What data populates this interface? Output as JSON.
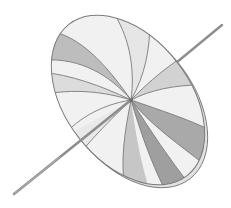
{
  "illustration": {
    "subject": "watercolor disc spinning top on a stick",
    "style": "grayscale watercolor",
    "colors": {
      "background": "#ffffff",
      "outline": "#7a7a7a",
      "light_segment": "#f1f1f1",
      "mid_segment": "#cfcfcf",
      "dark_segment": "#a9a9a9",
      "stick": "#8e8e8e",
      "rim": "#e2e2e2"
    }
  }
}
